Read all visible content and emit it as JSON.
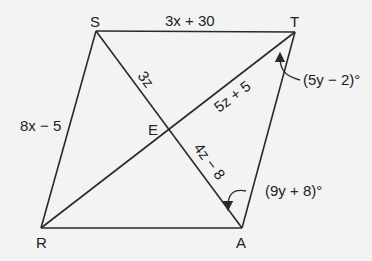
{
  "figure": {
    "type": "parallelogram-with-diagonals",
    "background": "#f3f3f3",
    "line_color": "#2a2a2a",
    "vertices": [
      {
        "id": "S",
        "label": "S",
        "x": 96,
        "y": 31
      },
      {
        "id": "T",
        "label": "T",
        "x": 295,
        "y": 32
      },
      {
        "id": "A",
        "label": "A",
        "x": 242,
        "y": 228
      },
      {
        "id": "R",
        "label": "R",
        "x": 41,
        "y": 228
      },
      {
        "id": "E",
        "label": "E",
        "x": 168,
        "y": 130
      }
    ],
    "sides": [
      {
        "from": "S",
        "to": "T",
        "label": "3x + 30"
      },
      {
        "from": "S",
        "to": "R",
        "label": "8x − 5"
      },
      {
        "from": "R",
        "to": "A",
        "label": ""
      },
      {
        "from": "A",
        "to": "T",
        "label": ""
      }
    ],
    "diagonal_segments": [
      {
        "from": "S",
        "to": "E",
        "label": "3z"
      },
      {
        "from": "E",
        "to": "T",
        "label": "5z + 5"
      },
      {
        "from": "E",
        "to": "A",
        "label": "4z − 8"
      },
      {
        "from": "R",
        "to": "E",
        "label": ""
      }
    ],
    "angles": [
      {
        "vertex": "T",
        "label": "(5y − 2)°",
        "between": [
          "RT",
          "TA"
        ]
      },
      {
        "vertex": "A",
        "label": "(9y + 8)°",
        "between": [
          "AT",
          "AS"
        ]
      }
    ]
  }
}
